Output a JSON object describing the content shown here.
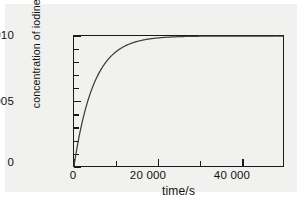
{
  "figure": {
    "background_color": "#ffffff",
    "panel_color": "#f1f1ef",
    "frame_color": "#1a1a1a",
    "curve_color": "#3d3d3d"
  },
  "axes": {
    "y_title_main": "concentration of iodine/mol litre",
    "y_title_exponent": "−1",
    "x_title": "time/s",
    "y_ticks": [
      {
        "value": 0,
        "label": "0"
      },
      {
        "value": 0.005,
        "label": "0.005"
      },
      {
        "value": 0.01,
        "label": "0.010"
      }
    ],
    "y_minor_ticks": [
      0.001,
      0.002,
      0.003,
      0.004,
      0.006,
      0.007,
      0.008,
      0.009
    ],
    "x_ticks": [
      {
        "value": 0,
        "label": "0"
      },
      {
        "value": 20000,
        "label": "20 000"
      },
      {
        "value": 40000,
        "label": "40 000"
      }
    ],
    "x_minor_ticks": [
      10000,
      30000,
      50000
    ]
  },
  "chart_data": {
    "type": "line",
    "title": "",
    "xlabel": "time/s",
    "ylabel": "concentration of iodine/mol litre−1",
    "xlim": [
      0,
      50000
    ],
    "ylim": [
      0,
      0.01
    ],
    "grid": false,
    "legend": "none",
    "equation": "c = 0.010 (1 − e^(−kt)), k ≈ 2.1e-4 s^-1",
    "plateau_value": 0.01,
    "half_rise_time": 3300,
    "x": [
      0,
      500,
      1000,
      1500,
      2000,
      2500,
      3000,
      3500,
      4000,
      5000,
      6000,
      7000,
      8000,
      9000,
      10000,
      12000,
      14000,
      16000,
      18000,
      20000,
      24000,
      28000,
      32000,
      36000,
      40000,
      44000,
      48000,
      50000
    ],
    "series": [
      {
        "name": "iodine concentration",
        "values": [
          0.0,
          0.001,
          0.0019,
          0.00271,
          0.00344,
          0.0041,
          0.00468,
          0.00521,
          0.00569,
          0.0065,
          0.00716,
          0.0077,
          0.00814,
          0.00849,
          0.00878,
          0.00921,
          0.00948,
          0.00966,
          0.00978,
          0.00985,
          0.00994,
          0.00997,
          0.00999,
          0.00999,
          0.01,
          0.01,
          0.01,
          0.01
        ]
      }
    ]
  }
}
